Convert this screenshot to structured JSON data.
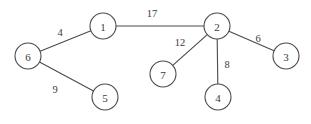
{
  "diagram": {
    "background_color": "#ffffff",
    "stroke_color": "#4a4a4a",
    "text_color": "#3a3a3a",
    "node_radius": 13,
    "nodes": [
      {
        "id": "1",
        "label": "1",
        "x": 103,
        "y": 26
      },
      {
        "id": "2",
        "label": "2",
        "x": 217,
        "y": 26
      },
      {
        "id": "3",
        "label": "3",
        "x": 286,
        "y": 56
      },
      {
        "id": "4",
        "label": "4",
        "x": 218,
        "y": 97
      },
      {
        "id": "5",
        "label": "5",
        "x": 105,
        "y": 97
      },
      {
        "id": "6",
        "label": "6",
        "x": 28,
        "y": 56
      },
      {
        "id": "7",
        "label": "7",
        "x": 163,
        "y": 74
      }
    ],
    "edges": [
      {
        "from": "1",
        "to": "2",
        "weight": "17",
        "label_x": 152,
        "label_y": 13
      },
      {
        "from": "6",
        "to": "1",
        "weight": "4",
        "label_x": 60,
        "label_y": 32
      },
      {
        "from": "6",
        "to": "5",
        "weight": "9",
        "label_x": 55,
        "label_y": 89
      },
      {
        "from": "2",
        "to": "7",
        "weight": "12",
        "label_x": 180,
        "label_y": 42
      },
      {
        "from": "2",
        "to": "4",
        "weight": "8",
        "label_x": 227,
        "label_y": 64
      },
      {
        "from": "2",
        "to": "3",
        "weight": "6",
        "label_x": 258,
        "label_y": 38
      }
    ]
  }
}
